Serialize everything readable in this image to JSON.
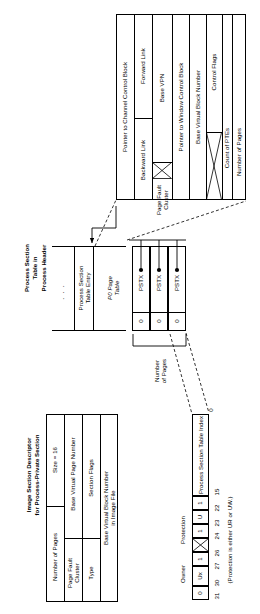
{
  "figure": {
    "orientation": "rotated-90-ccw",
    "title_absent": true
  },
  "process_section_table": {
    "heading_lines": [
      "Process Section",
      "Table in",
      "Process Header"
    ],
    "ellipsis": ". . .",
    "entry_label_lines": [
      "Process Section",
      "Table Entry"
    ],
    "p0_page_table_label_lines": [
      "P0 Page",
      "Table"
    ],
    "pte_rows": [
      {
        "valid_bit": "0",
        "type": "PSTX"
      },
      {
        "valid_bit": "0",
        "type": "PSTX"
      },
      {
        "valid_bit": "0",
        "type": "PSTX"
      }
    ],
    "number_of_pages_bracket_lines": [
      "Number",
      "of Pages"
    ]
  },
  "pste_fields": [
    {
      "label": "Pointer to Channel Control Block",
      "span": "full"
    },
    {
      "label": "Forward Link",
      "span": "half"
    },
    {
      "label": "Backward Link",
      "span": "half"
    },
    {
      "label": "Base VPN",
      "span": "part"
    },
    {
      "label": "Page Fault Cluster",
      "span": "part",
      "crossed": true
    },
    {
      "label": "Pointer to Window Control Block",
      "span": "full"
    },
    {
      "label": "Base Virtual Block Number",
      "span": "full"
    },
    {
      "label": "Control Flags",
      "span": "part"
    },
    {
      "label": "Count of PTEs",
      "span": "part",
      "crossed": true
    },
    {
      "label": "Number of Pages",
      "span": "full"
    }
  ],
  "image_section_descriptor": {
    "heading_lines": [
      "Image Section Descriptor",
      "for Process-Private Section"
    ],
    "rows": [
      {
        "left": "Number of Pages",
        "right": "Size = 16"
      },
      {
        "left": "Page Fault Cluster",
        "right": "Base Virtual Page Number"
      },
      {
        "left": "Type",
        "right": "Section Flags"
      },
      {
        "left": "",
        "right": "Base Virtual Block Number in Image File"
      }
    ],
    "row_labels_multiline": {
      "page_fault_cluster": [
        "Page Fault",
        "Cluster"
      ],
      "base_virtual_block_number": [
        "Base Virtual Block Number",
        "in Image File"
      ]
    }
  },
  "pstx_longword": {
    "group_labels": [
      "Protection",
      "Owner"
    ],
    "cells": [
      {
        "value": "0"
      },
      {
        "value": "Ux"
      },
      {
        "value": "1"
      },
      {
        "value": "",
        "crossed": true
      },
      {
        "value": "1"
      },
      {
        "value": "U"
      },
      {
        "value": "1"
      },
      {
        "value": "",
        "wide": true,
        "label": "Process Section Table Index"
      }
    ],
    "bit_numbers": [
      "31",
      "30",
      "27",
      "26",
      "24",
      "23",
      "22",
      "15",
      "0"
    ],
    "footnote": "(Protection is either UR or UW.)"
  },
  "colors": {
    "ink": "#000000",
    "paper": "#ffffff"
  }
}
